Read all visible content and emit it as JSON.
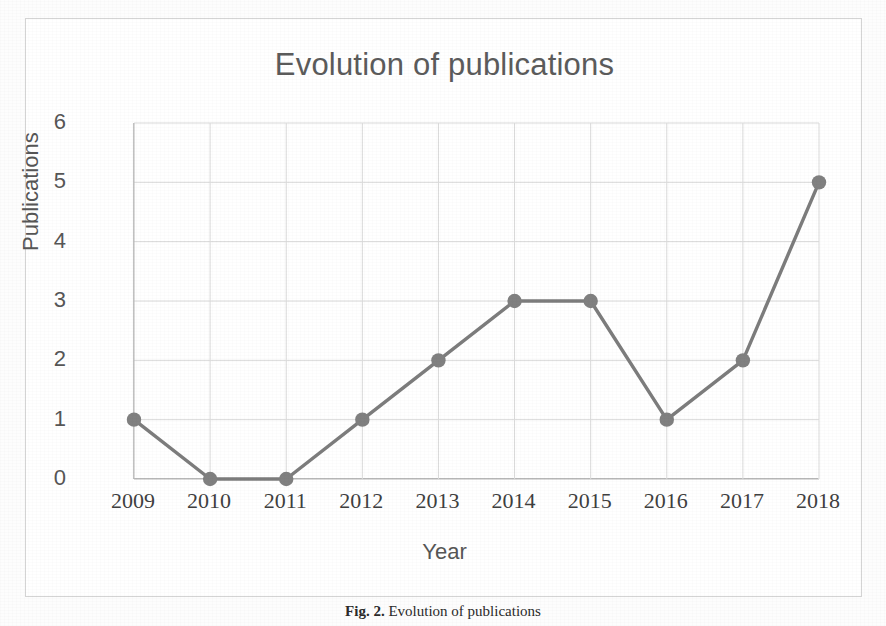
{
  "figure": {
    "caption_label": "Fig. 2.",
    "caption_text": "Evolution of publications"
  },
  "chart_data": {
    "type": "line",
    "title": "Evolution of publications",
    "xlabel": "Year",
    "ylabel": "Publications",
    "categories": [
      "2009",
      "2010",
      "2011",
      "2012",
      "2013",
      "2014",
      "2015",
      "2016",
      "2017",
      "2018"
    ],
    "values": [
      1,
      0,
      0,
      1,
      2,
      3,
      3,
      1,
      2,
      5
    ],
    "ylim": [
      0,
      6
    ],
    "yticks": [
      "0",
      "1",
      "2",
      "3",
      "4",
      "5",
      "6"
    ],
    "grid": "both",
    "legend": "none",
    "series": [
      {
        "name": "Publications",
        "values": [
          1,
          0,
          0,
          1,
          2,
          3,
          3,
          1,
          2,
          5
        ],
        "marker": "circle",
        "color": "#808080"
      }
    ],
    "colors": {
      "line": "#7c7c7c",
      "marker": "#808080",
      "grid": "#d9d9d9",
      "axis": "#b8b8b8",
      "title_text": "#5b5b5b",
      "tick_text": "#3f3f3f"
    }
  }
}
